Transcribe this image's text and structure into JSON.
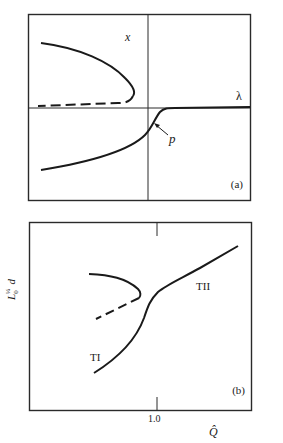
{
  "figure": {
    "panel_a": {
      "tag": "(a)",
      "y_axis_label": "x",
      "x_axis_label": "λ",
      "point_label": "p",
      "curves": [
        {
          "name": "upper-stable-branch",
          "style": "solid"
        },
        {
          "name": "upper-unstable-branch",
          "style": "dashed"
        },
        {
          "name": "lower-branch",
          "style": "solid"
        }
      ]
    },
    "panel_b": {
      "tag": "(b)",
      "y_axis_label_main": "L",
      "y_axis_label_sup": "¼",
      "y_axis_label_sub": "0",
      "y_axis_label_var": "d",
      "x_axis_label": "Q̂",
      "x_tick_label": "1.0",
      "branch_label_lower": "TI",
      "branch_label_upper": "TII",
      "curves": [
        {
          "name": "fold-stable-branch",
          "style": "solid"
        },
        {
          "name": "fold-unstable-branch",
          "style": "dashed"
        },
        {
          "name": "main-branch",
          "style": "solid"
        }
      ]
    },
    "colors": {
      "ink": "#1a1a1a",
      "frame": "#2a2a2a",
      "background": "#ffffff"
    }
  }
}
